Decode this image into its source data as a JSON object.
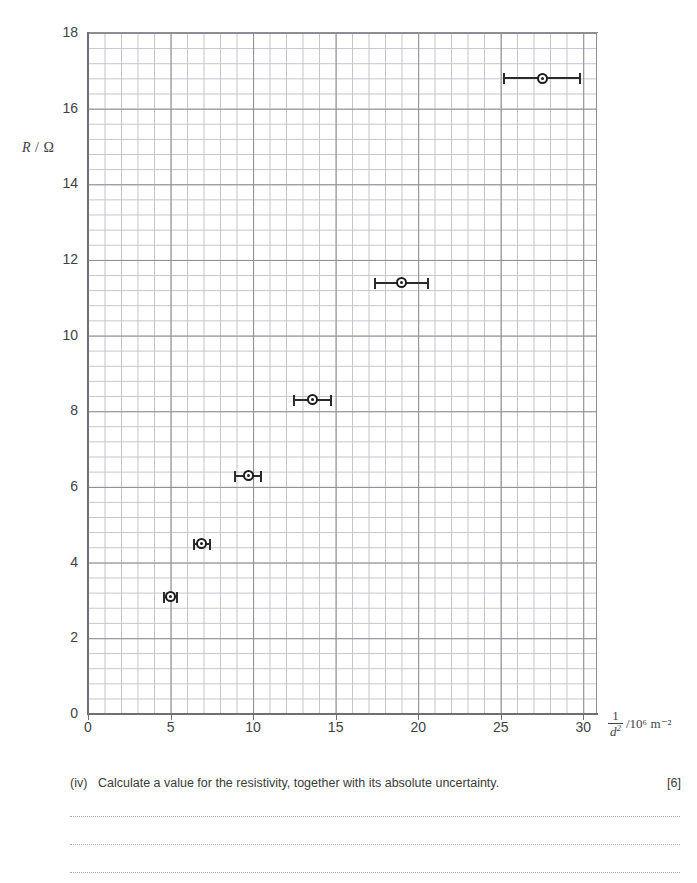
{
  "chart_data": {
    "type": "scatter",
    "title": "",
    "xlabel": "1/d^2 /10^6 m^-2",
    "ylabel": "R / Ω",
    "xlim": [
      0,
      32.5
    ],
    "ylim": [
      0,
      18
    ],
    "grid": true,
    "legend": "none",
    "x_ticks": [
      "0",
      "5",
      "10",
      "15",
      "20",
      "25",
      "30"
    ],
    "x_tick_values": [
      0,
      5,
      10,
      15,
      20,
      25,
      30
    ],
    "y_ticks": [
      "0",
      "2",
      "4",
      "6",
      "8",
      "10",
      "12",
      "14",
      "16",
      "18"
    ],
    "y_tick_values": [
      0,
      2,
      4,
      6,
      8,
      10,
      12,
      14,
      16,
      18
    ],
    "x_major_step": 5,
    "y_major_step": 2,
    "error_bars": "x-only",
    "points": [
      {
        "x": 5.0,
        "y": 3.1,
        "xerr": 0.4
      },
      {
        "x": 6.9,
        "y": 4.5,
        "xerr": 0.5
      },
      {
        "x": 9.7,
        "y": 6.3,
        "xerr": 0.8
      },
      {
        "x": 13.6,
        "y": 8.3,
        "xerr": 1.1
      },
      {
        "x": 19.0,
        "y": 11.4,
        "xerr": 1.6
      },
      {
        "x": 27.5,
        "y": 16.8,
        "xerr": 2.3
      }
    ],
    "marker_style": "open-ring-with-centre-dot"
  },
  "axes": {
    "y_label_symbol": "R",
    "y_label_separator": " / ",
    "y_label_unit": "Ω",
    "x_label_numerator": "1",
    "x_label_denominator": "d",
    "x_label_denominator_exponent": "2",
    "x_label_unit": "/10⁶ m⁻²"
  },
  "question": {
    "numeral": "(iv)",
    "text": "Calculate a value for the resistivity, together with its absolute uncertainty.",
    "marks": "[6]",
    "answer_lines": 3
  },
  "colors": {
    "grid_minor": "#c3c3cb",
    "grid_major": "#8d8d96",
    "axis": "#6f6f79",
    "marker": "#1e1e1e",
    "text": "#3a3a3a"
  }
}
